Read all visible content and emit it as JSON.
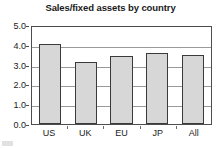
{
  "chart_data": {
    "type": "bar",
    "title": "Sales/fixed assets by country",
    "xlabel": "",
    "ylabel": "",
    "categories": [
      "US",
      "UK",
      "EU",
      "JP",
      "All"
    ],
    "values": [
      4.05,
      3.15,
      3.45,
      3.6,
      3.5
    ],
    "ylim": [
      0.0,
      5.0
    ],
    "ytick_labels": [
      "0.0",
      "1.0",
      "2.0",
      "3.0",
      "4.0",
      "5.0"
    ],
    "ytick_values": [
      0.0,
      1.0,
      2.0,
      3.0,
      4.0,
      5.0
    ],
    "grid": true,
    "legend": false,
    "colors": {
      "bar_fill": "#d7d7d7",
      "bar_border": "#3a3a3a",
      "gridline": "#9a9a9a",
      "axis": "#4d4d4d",
      "text": "#1a1a1a",
      "background": "#ffffff"
    }
  }
}
